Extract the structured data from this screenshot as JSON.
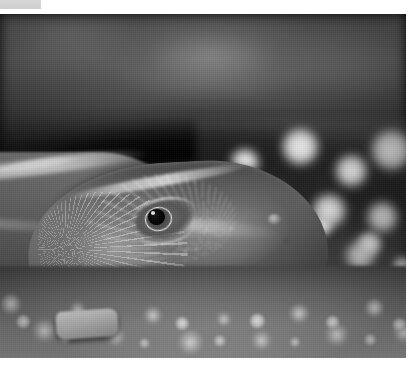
{
  "page": {
    "background_color": "#ffffff",
    "width": 417,
    "height": 377
  },
  "topbar_fragment": {
    "name": "cropped-toolbar-strip",
    "color": "#d4d4d4",
    "label": ""
  },
  "photo": {
    "title": "",
    "alt": "Black and white close-up photograph of a catfish head resting on aquarium gravel",
    "subject": "catfish-head",
    "color_mode": "black-and-white",
    "border_color": "#ffffff",
    "regions": {
      "background": "blurred dark driftwood",
      "substrate": "pale aquarium gravel",
      "fish_features": "eye, snout, barbel, textured skin"
    }
  },
  "caption": {
    "text": ""
  }
}
